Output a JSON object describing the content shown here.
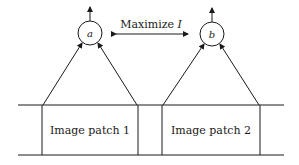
{
  "diagram": {
    "objective_label": "Maximize",
    "objective_symbol": "I",
    "units": [
      {
        "id": "a",
        "label": "a",
        "input_label": "Image patch 1"
      },
      {
        "id": "b",
        "label": "b",
        "input_label": "Image patch 2"
      }
    ],
    "colors": {
      "stroke": "#1a1a1a",
      "background": "#ffffff"
    }
  }
}
